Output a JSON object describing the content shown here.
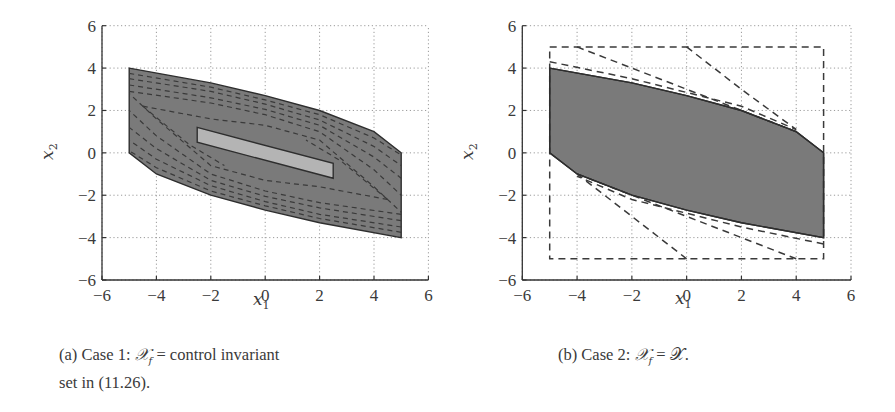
{
  "figure": {
    "panels": [
      {
        "id": "a",
        "caption_prefix": "(a) Case 1: ",
        "caption_math": "𝒳",
        "caption_sub": "f",
        "caption_rest": " = control invariant",
        "caption_line2": "set in (11.26).",
        "xlabel": "x",
        "xlabel_sub": "1",
        "ylabel": "x",
        "ylabel_sub": "2"
      },
      {
        "id": "b",
        "caption_prefix": "(b) Case 2: ",
        "caption_math": "𝒳",
        "caption_sub": "f",
        "caption_rest": " = 𝒳.",
        "xlabel": "x",
        "xlabel_sub": "1",
        "ylabel": "x",
        "ylabel_sub": "2"
      }
    ],
    "ticks": [
      "−6",
      "−4",
      "−2",
      "0",
      "2",
      "4",
      "6"
    ]
  },
  "chart_data": [
    {
      "type": "area",
      "title": "(a) Case 1: X_f = control invariant set in (11.26).",
      "xlabel": "x1",
      "ylabel": "x2",
      "xlim": [
        -6,
        6
      ],
      "ylim": [
        -6,
        6
      ],
      "xticks": [
        -6,
        -4,
        -2,
        0,
        2,
        4,
        6
      ],
      "yticks": [
        -6,
        -4,
        -2,
        0,
        2,
        4,
        6
      ],
      "grid": "dotted",
      "colors": {
        "outer_fill": "#7a7a7a",
        "inner_fill": "#b4b4b4",
        "edge": "#2e2e2e"
      },
      "series": [
        {
          "name": "maximal feasible set (outer polytope)",
          "polygon": [
            [
              -5,
              4
            ],
            [
              -2,
              3.3
            ],
            [
              0,
              2.7
            ],
            [
              2,
              2
            ],
            [
              4,
              1
            ],
            [
              5,
              0
            ],
            [
              5,
              -4
            ],
            [
              2,
              -3.3
            ],
            [
              0,
              -2.7
            ],
            [
              -2,
              -2
            ],
            [
              -4,
              -1
            ],
            [
              -5,
              0
            ]
          ]
        },
        {
          "name": "terminal set X_f (inner polytope)",
          "polygon": [
            [
              -2.5,
              1.2
            ],
            [
              2.5,
              -0.5
            ],
            [
              2.5,
              -1.2
            ],
            [
              -2.5,
              0.5
            ]
          ]
        },
        {
          "name": "intermediate N-step sets (dashed)",
          "style": "dashed",
          "count_approx": 10
        }
      ]
    },
    {
      "type": "area",
      "title": "(b) Case 2: X_f = X.",
      "xlabel": "x1",
      "ylabel": "x2",
      "xlim": [
        -6,
        6
      ],
      "ylim": [
        -6,
        6
      ],
      "xticks": [
        -6,
        -4,
        -2,
        0,
        2,
        4,
        6
      ],
      "yticks": [
        -6,
        -4,
        -2,
        0,
        2,
        4,
        6
      ],
      "grid": "dotted",
      "colors": {
        "outer_fill": "#7a7a7a",
        "edge": "#2e2e2e"
      },
      "series": [
        {
          "name": "maximal feasible set",
          "polygon": [
            [
              -5,
              4
            ],
            [
              -2,
              3.3
            ],
            [
              0,
              2.7
            ],
            [
              2,
              2
            ],
            [
              4,
              1
            ],
            [
              5,
              0
            ],
            [
              5,
              -4
            ],
            [
              2,
              -3.3
            ],
            [
              0,
              -2.7
            ],
            [
              -2,
              -2
            ],
            [
              -4,
              -1
            ],
            [
              -5,
              0
            ]
          ]
        },
        {
          "name": "state constraint set X (dashed box)",
          "style": "dashed",
          "polygon": [
            [
              -5,
              5
            ],
            [
              5,
              5
            ],
            [
              5,
              -5
            ],
            [
              -5,
              -5
            ]
          ]
        },
        {
          "name": "intermediate sets (dashed)",
          "style": "dashed",
          "lines": [
            [
              [
                -4,
                5
              ],
              [
                -2,
                4
              ],
              [
                4,
                1
              ]
            ],
            [
              [
                0,
                5
              ],
              [
                2,
                3
              ],
              [
                4,
                1.1
              ]
            ],
            [
              [
                -5,
                4.3
              ],
              [
                -2,
                3.5
              ],
              [
                2,
                2.2
              ],
              [
                4,
                1.1
              ]
            ],
            [
              [
                4,
                -5
              ],
              [
                0,
                -3
              ],
              [
                -4,
                -1
              ]
            ],
            [
              [
                0,
                -5
              ],
              [
                -2,
                -3
              ],
              [
                -4,
                -1
              ]
            ],
            [
              [
                5,
                -4.3
              ],
              [
                2,
                -3.5
              ],
              [
                -2,
                -2.2
              ],
              [
                -4,
                -1.1
              ]
            ]
          ]
        }
      ]
    }
  ]
}
